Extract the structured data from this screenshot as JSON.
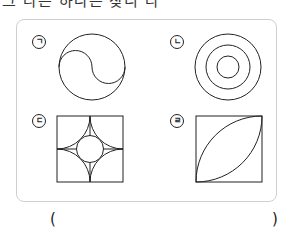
{
  "question": {
    "text_fragment": "그 다른 하나는 찾니 다"
  },
  "figures": [
    {
      "label": "ㄱ",
      "shape": "circle-with-s-curve"
    },
    {
      "label": "ㄴ",
      "shape": "three-concentric-circles"
    },
    {
      "label": "ㄷ",
      "shape": "square-with-four-quarter-arcs-and-inner-circle"
    },
    {
      "label": "ㄹ",
      "shape": "square-with-two-quarter-arcs-leaf"
    }
  ],
  "answer": {
    "open_paren": "(",
    "close_paren": ")"
  },
  "colors": {
    "stroke": "#222222",
    "box_border": "#cfcfcf"
  }
}
